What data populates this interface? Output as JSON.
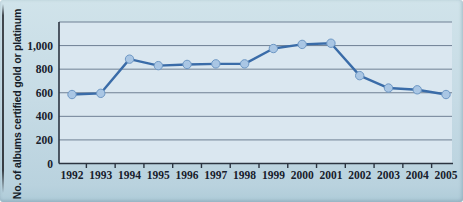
{
  "figure": {
    "ylabel": "No. of albums certified gold or platinum"
  },
  "chart_data": {
    "type": "line",
    "title": "",
    "xlabel": "",
    "ylabel": "No. of albums certified gold or platinum",
    "categories": [
      "1992",
      "1993",
      "1994",
      "1995",
      "1996",
      "1997",
      "1998",
      "1999",
      "2000",
      "2001",
      "2002",
      "2003",
      "2004",
      "2005"
    ],
    "values": [
      585,
      595,
      885,
      830,
      840,
      845,
      845,
      975,
      1010,
      1020,
      745,
      640,
      625,
      585
    ],
    "ylim": [
      0,
      1200
    ],
    "yticks": [
      0,
      200,
      400,
      600,
      800,
      1000
    ],
    "ytick_labels": [
      "0",
      "200",
      "400",
      "600",
      "800",
      "1,000"
    ],
    "grid": true,
    "legend": "none",
    "colors": {
      "card_bg": "#c6dbe5",
      "plot_bg": "#dae7f0",
      "gridline": "#6f8094",
      "axis": "#2b3440",
      "line": "#3a6ca8",
      "marker_fill": "#a9c6e4",
      "marker_edge": "#6d97c4",
      "text": "#18202c"
    }
  }
}
